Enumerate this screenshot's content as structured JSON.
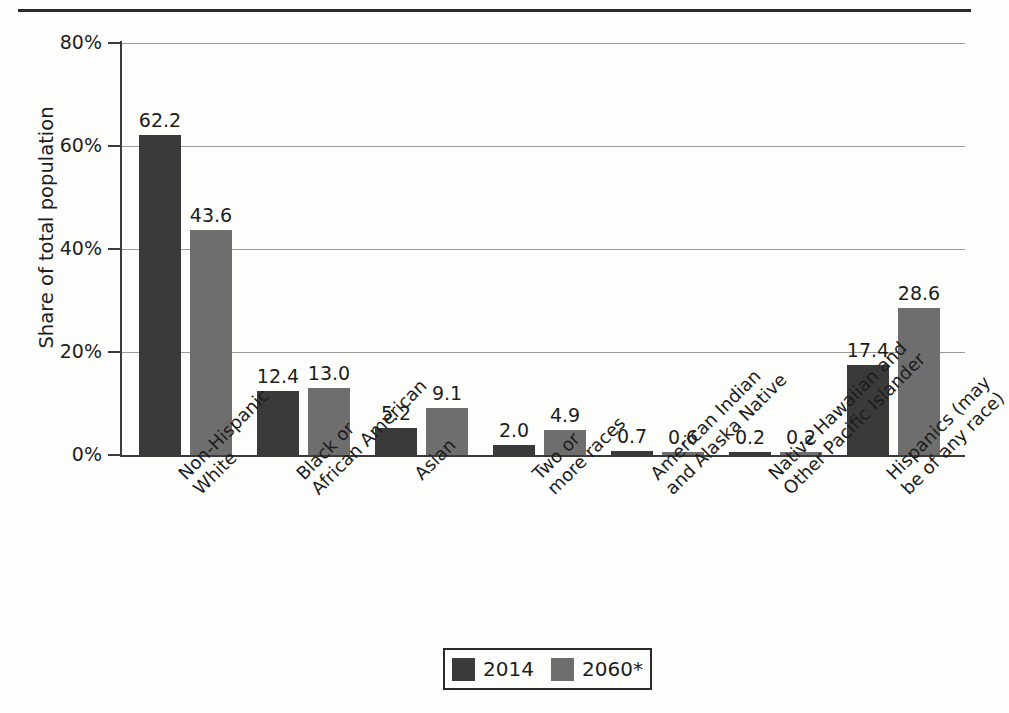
{
  "figure": {
    "y_axis_title": "Share of total population"
  },
  "legend": {
    "items": [
      {
        "label": "2014",
        "color": "#3a3a3a",
        "swatch_name": "legend-swatch-2014"
      },
      {
        "label": "2060*",
        "color": "#6e6e6e",
        "swatch_name": "legend-swatch-2060"
      }
    ]
  },
  "chart_data": {
    "type": "bar",
    "title": "",
    "xlabel": "",
    "ylabel": "Share of total population",
    "ylim": [
      0,
      80
    ],
    "yticks": [
      0,
      20,
      40,
      60,
      80
    ],
    "ytick_labels": [
      "0%",
      "20%",
      "40%",
      "60%",
      "80%"
    ],
    "grid": true,
    "legend_position": "bottom",
    "categories": [
      "Non-Hispanic\nWhite",
      "Black or\nAfrican American",
      "Asian",
      "Two or\nmore races",
      "American Indian\nand Alaska Native",
      "Native Hawaiian and\nOther Pacific Islander",
      "Hispanics (may\nbe of any race)"
    ],
    "series": [
      {
        "name": "2014",
        "color": "#3a3a3a",
        "values": [
          62.2,
          12.4,
          5.2,
          2.0,
          0.7,
          0.2,
          17.4
        ]
      },
      {
        "name": "2060*",
        "color": "#6e6e6e",
        "values": [
          43.6,
          13.0,
          9.1,
          4.9,
          0.6,
          0.2,
          28.6
        ]
      }
    ],
    "value_labels": [
      [
        "62.2",
        "43.6"
      ],
      [
        "12.4",
        "13.0"
      ],
      [
        "5.2",
        "9.1"
      ],
      [
        "2.0",
        "4.9"
      ],
      [
        "0.7",
        "0.6"
      ],
      [
        "0.2",
        "0.2"
      ],
      [
        "17.4",
        "28.6"
      ]
    ]
  }
}
